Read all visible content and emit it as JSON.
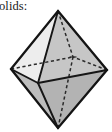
{
  "page": {
    "width": 112,
    "height": 132,
    "background_color": "#ffffff",
    "kind": "textbook-figure-fragment"
  },
  "caption": {
    "text": "olids:",
    "note_clipped_left": true,
    "full_word_implied": "solids:",
    "color": "#1a1a1a"
  },
  "figure": {
    "name": "octahedron",
    "label": "octahedron",
    "face_count": 8,
    "vertex_count": 6,
    "edge_count": 12,
    "projection": "oblique-perspective",
    "colors": {
      "edge_solid": "#161616",
      "edge_hidden": "#2b2b2b",
      "face_upper_left": "#ededed",
      "face_upper_right": "#c6c6c6",
      "face_lower_left": "#bdbdbd",
      "face_lower_right": "#b4b4b4",
      "face_upper_back": "#d8d8d8",
      "face_lower_back": "#c9c9c9",
      "outline": "#141414"
    },
    "vertices": {
      "top": {
        "x": 58,
        "y": 11
      },
      "bottom": {
        "x": 58,
        "y": 128
      },
      "left": {
        "x": 11,
        "y": 69
      },
      "right": {
        "x": 107,
        "y": 70
      },
      "front": {
        "x": 38,
        "y": 83
      },
      "back": {
        "x": 73,
        "y": 57
      }
    },
    "edges_visible": [
      [
        "top",
        "left"
      ],
      [
        "top",
        "right"
      ],
      [
        "top",
        "front"
      ],
      [
        "bottom",
        "left"
      ],
      [
        "bottom",
        "right"
      ],
      [
        "bottom",
        "front"
      ],
      [
        "left",
        "front"
      ],
      [
        "right",
        "front"
      ]
    ],
    "edges_hidden": [
      [
        "top",
        "back"
      ],
      [
        "bottom",
        "back"
      ],
      [
        "left",
        "back"
      ],
      [
        "right",
        "back"
      ]
    ],
    "stroke_widths": {
      "outline": 2.3,
      "interior_solid": 1.9,
      "hidden_dashed": 1.5
    },
    "dash_pattern": "3.2 2.6"
  }
}
